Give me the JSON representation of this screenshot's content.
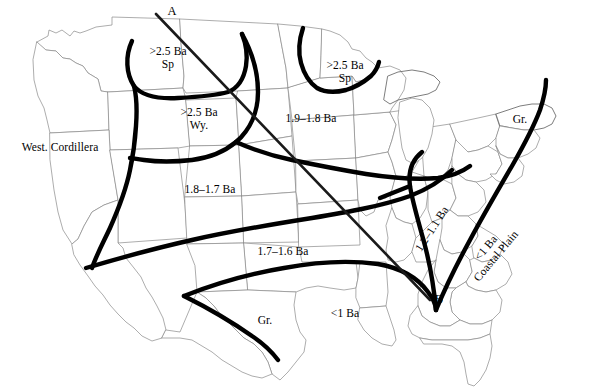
{
  "figure": {
    "type": "geologic-basement-age-map",
    "region": "conterminous United States"
  },
  "section_line": {
    "start_label": "A",
    "end_label": "B"
  },
  "labels": [
    {
      "id": "section-a",
      "text": "A",
      "x": 172,
      "y": 11,
      "rotate": 0,
      "size": 12.5
    },
    {
      "id": "section-b",
      "text": "B",
      "x": 439,
      "y": 299,
      "rotate": 0,
      "size": 12.5
    },
    {
      "id": "superior-west",
      "line1": ">2.5 Ba",
      "line2": "Sp",
      "x": 168,
      "y": 58,
      "rotate": 0,
      "size": 11.5
    },
    {
      "id": "superior-east",
      "line1": ">2.5 Ba",
      "line2": "Sp",
      "x": 345,
      "y": 72,
      "rotate": 0,
      "size": 11.5
    },
    {
      "id": "wyoming",
      "line1": ">2.5 Ba",
      "line2": "Wy.",
      "x": 199,
      "y": 119,
      "rotate": 0,
      "size": 11.5
    },
    {
      "id": "west-cordillera",
      "text": "West. Cordillera",
      "x": 60,
      "y": 147,
      "rotate": 0,
      "size": 11.5
    },
    {
      "id": "prov-19-18",
      "text": "1.9–1.8 Ba",
      "x": 311,
      "y": 118,
      "rotate": 0,
      "size": 11.5
    },
    {
      "id": "prov-18-17",
      "text": "1.8–1.7 Ba",
      "x": 210,
      "y": 189,
      "rotate": 0,
      "size": 11.5
    },
    {
      "id": "prov-17-16",
      "text": "1.7–1.6 Ba",
      "x": 283,
      "y": 251,
      "rotate": 0,
      "size": 11.5
    },
    {
      "id": "grenville-tx",
      "text": "Gr.",
      "x": 265,
      "y": 320,
      "rotate": 0,
      "size": 11.5
    },
    {
      "id": "grenville-ne",
      "text": "Gr.",
      "x": 520,
      "y": 119,
      "rotate": 0,
      "size": 11.5
    },
    {
      "id": "gulf-lt1",
      "text": "<1 Ba",
      "x": 345,
      "y": 313,
      "rotate": 0,
      "size": 11.5
    },
    {
      "id": "prov-12-11",
      "text": "1.2–1.1 Ba",
      "x": 432,
      "y": 229,
      "rotate": -57,
      "size": 11.5
    },
    {
      "id": "coastal-plain",
      "line1": "<1 Ba",
      "line2": "Coastal Plain",
      "x": 491,
      "y": 252,
      "rotate": -50,
      "size": 11.5
    }
  ],
  "colors": {
    "province_boundary": "#000000",
    "section_line": "#1a1a1a",
    "state_border": "#8a8a8a",
    "background": "#ffffff"
  }
}
